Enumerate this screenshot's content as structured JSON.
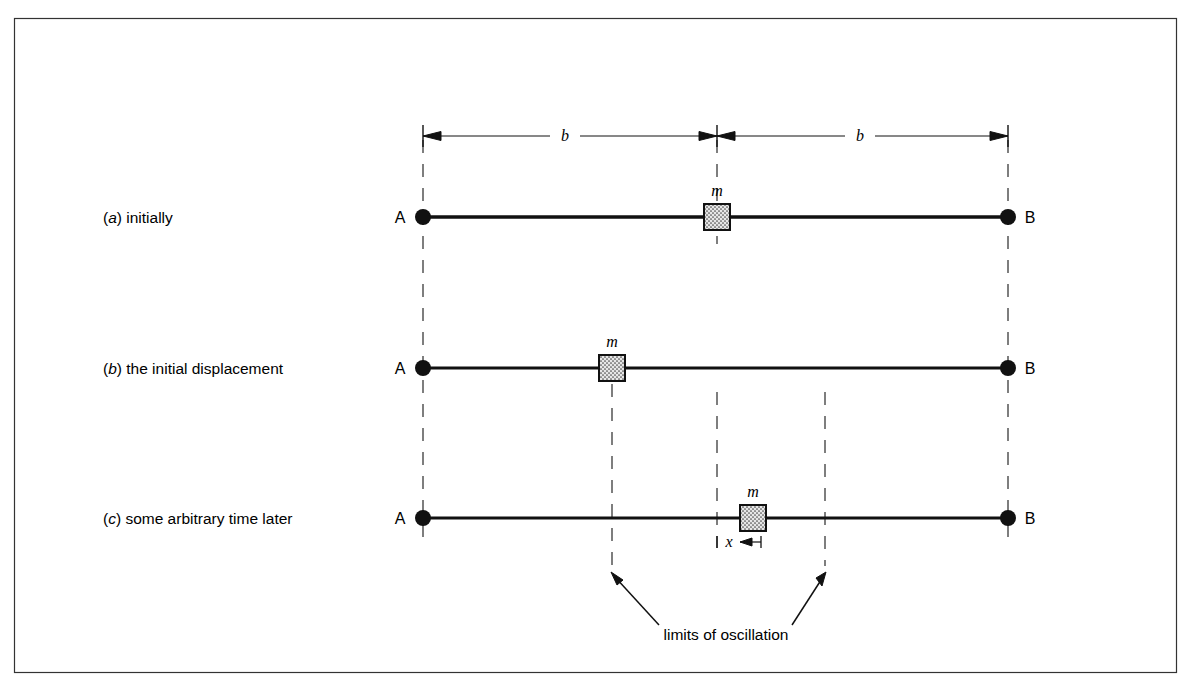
{
  "figure": {
    "frame": {
      "x": 14,
      "y": 18,
      "width": 1163,
      "height": 655,
      "stroke": "#1a1a1a"
    },
    "colors": {
      "ink": "#111111",
      "line": "#111111",
      "dash": "#444444",
      "mass_fill": "#e2e2e2",
      "background": "#ffffff"
    },
    "geometry": {
      "x_A": 423,
      "x_center": 717,
      "x_B": 1008,
      "x_limit_left": 612,
      "x_limit_right": 825,
      "y_dim": 135,
      "y_row_a": 217,
      "y_row_b": 368,
      "y_row_c": 518,
      "mass_size": 26
    },
    "dimension": {
      "left_label": "b",
      "right_label": "b",
      "displacement_label": "x"
    },
    "mass_label": "m",
    "endpoints": {
      "left": "A",
      "right": "B"
    },
    "caption": "limits of oscillation",
    "rows": [
      {
        "key": "a",
        "tag": "(a)",
        "tag_letter": "a",
        "label": "initially",
        "mass_x": 717,
        "y": 217
      },
      {
        "key": "b",
        "tag": "(b)",
        "tag_letter": "b",
        "label": "the initial displacement",
        "mass_x": 612,
        "y": 368
      },
      {
        "key": "c",
        "tag": "(c)",
        "tag_letter": "c",
        "label": "some arbitrary time later",
        "mass_x": 753,
        "y": 518
      }
    ]
  }
}
